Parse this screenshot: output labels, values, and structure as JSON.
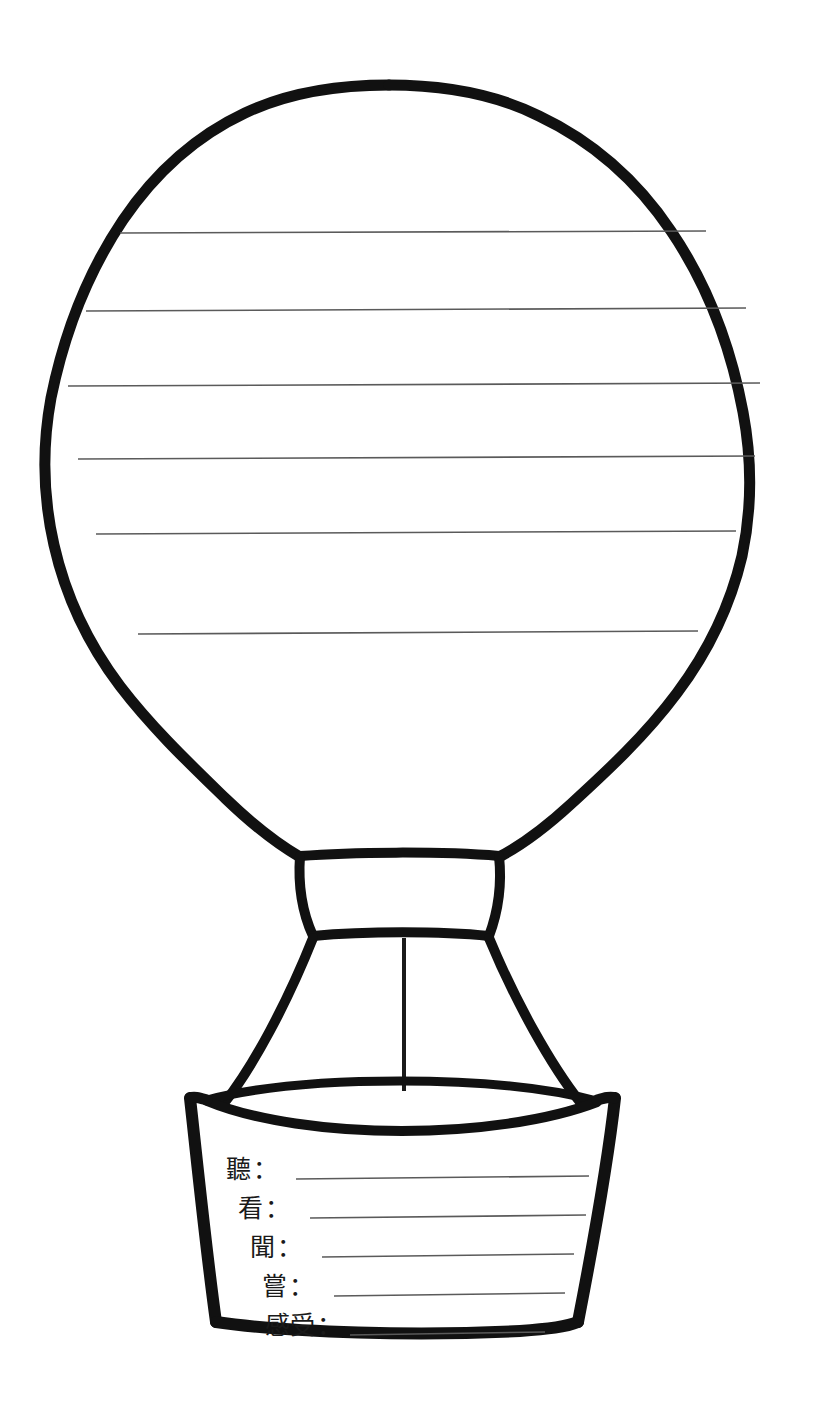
{
  "page": {
    "background_color": "#ffffff",
    "ink_color": "#111111",
    "rule_line_color": "#5a5a5a",
    "width": 823,
    "height": 1401
  },
  "worksheet": {
    "kind": "hot-air-balloon-five-senses-writing-template",
    "envelope": {
      "name": "balloon-envelope",
      "writing_lines_count": 6,
      "writing_lines": [
        {
          "index": 1,
          "y": 233,
          "x_start": 120,
          "x_end": 706
        },
        {
          "index": 2,
          "y": 310,
          "x_start": 86,
          "x_end": 746
        },
        {
          "index": 3,
          "y": 385,
          "x_start": 68,
          "x_end": 760
        },
        {
          "index": 4,
          "y": 458,
          "x_start": 78,
          "x_end": 755
        },
        {
          "index": 5,
          "y": 533,
          "x_start": 96,
          "x_end": 736
        },
        {
          "index": 6,
          "y": 633,
          "x_start": 138,
          "x_end": 698
        }
      ]
    },
    "skirt": {
      "name": "balloon-skirt"
    },
    "ropes": {
      "name": "balloon-ropes",
      "count": 2,
      "center_line": true
    },
    "basket": {
      "name": "balloon-basket",
      "rows": [
        {
          "label": "聽",
          "colon": "：",
          "value": "",
          "line_x_start": 296,
          "line_x_end": 589,
          "y": 1170
        },
        {
          "label": "看",
          "colon": "：",
          "value": "",
          "line_x_start": 310,
          "line_x_end": 586,
          "y": 1209
        },
        {
          "label": "聞",
          "colon": "：",
          "value": "",
          "line_x_start": 322,
          "line_x_end": 574,
          "y": 1248
        },
        {
          "label": "嘗",
          "colon": "：",
          "value": "",
          "line_x_start": 334,
          "line_x_end": 565,
          "y": 1287
        },
        {
          "label": "感受",
          "colon": "：",
          "value": "",
          "line_x_start": 350,
          "line_x_end": 545,
          "y": 1326
        }
      ]
    }
  }
}
